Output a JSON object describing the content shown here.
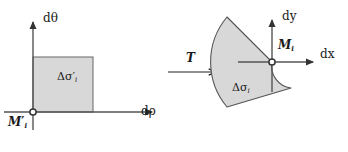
{
  "figure": {
    "name": "coordinate-transformation-diagram",
    "background_color": "#ffffff",
    "stroke_color": "#333333",
    "fill_color": "#d8d8d8"
  },
  "left_panel": {
    "name": "parametric-domain-panel",
    "y_axis_label": "dθ",
    "x_axis_label": "dρ",
    "region_label": "Δσ",
    "region_label_prime": "′",
    "region_label_sub": "i",
    "origin_label": "M",
    "origin_label_prime": "′",
    "origin_label_sub": "i",
    "origin": {
      "x": 33,
      "y": 112
    },
    "rectangle": {
      "x": 33,
      "y": 57,
      "width": 60,
      "height": 55
    }
  },
  "map_arrow": {
    "name": "transformation-arrow",
    "label": "T",
    "from_x": 168,
    "to_x": 215,
    "y": 72
  },
  "right_panel": {
    "name": "physical-domain-panel",
    "y_axis_label": "dy",
    "x_axis_label": "dx",
    "region_label": "Δσ",
    "region_label_sub": "i",
    "origin_label": "M",
    "origin_label_sub": "i",
    "origin": {
      "x": 272,
      "y": 62
    },
    "sector": {
      "outer_radius": 70,
      "inner_radius": 22,
      "start_angle_deg": 130,
      "end_angle_deg": 230
    }
  }
}
